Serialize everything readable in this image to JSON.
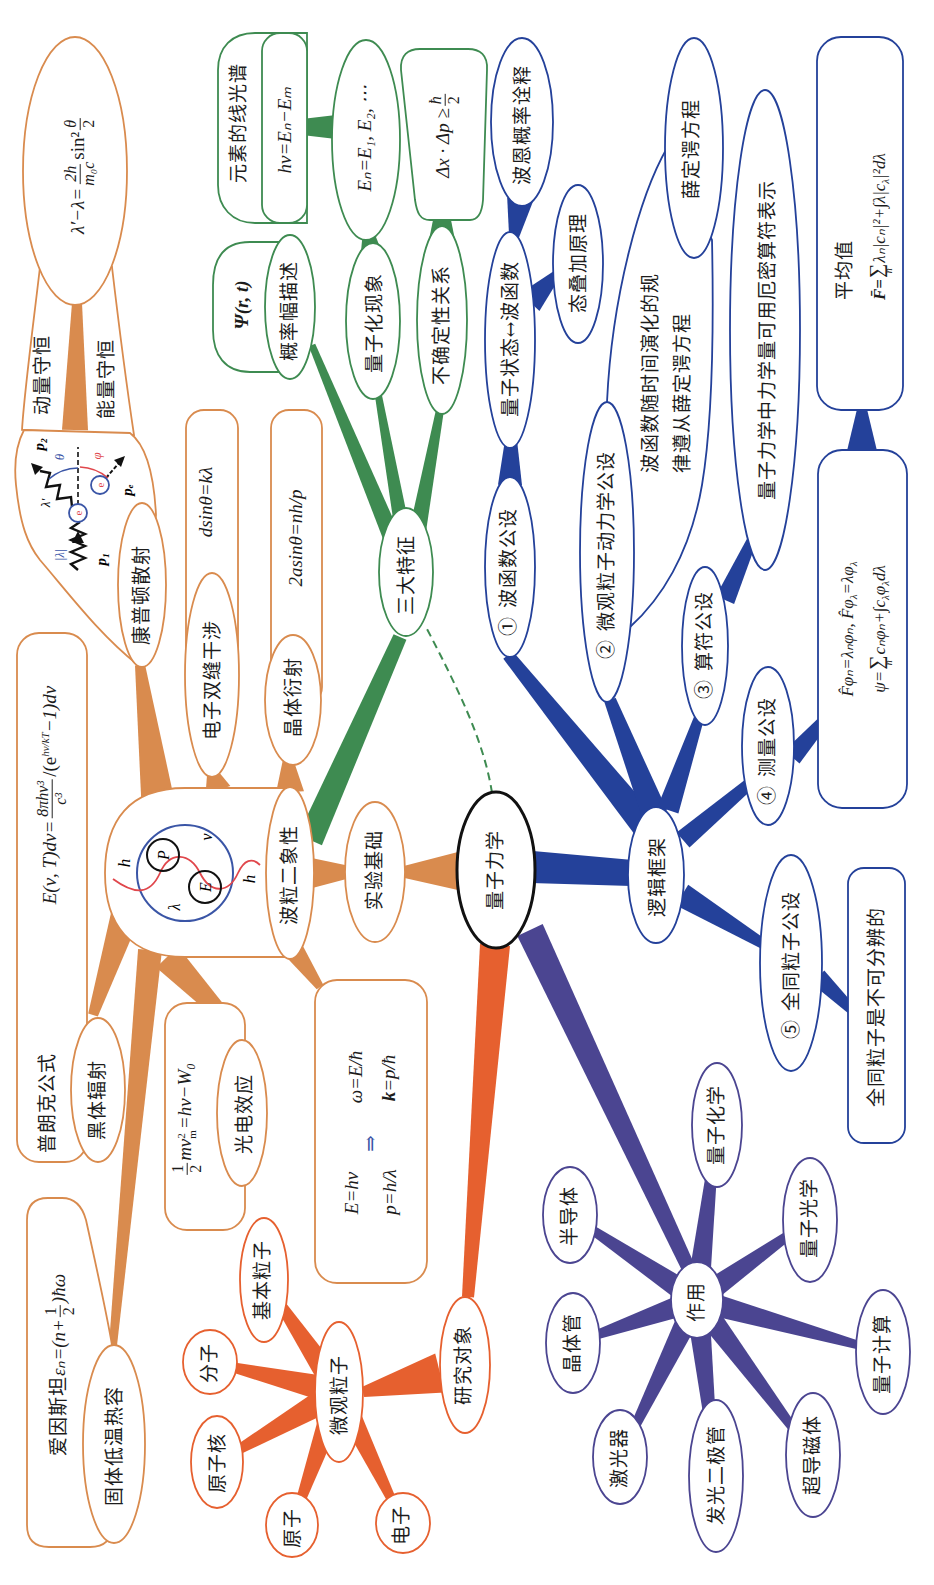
{
  "colors": {
    "orange": "#d98b4e",
    "red_orange": "#e6602f",
    "green": "#3e8b51",
    "blue": "#24419a",
    "purple": "#4b4591",
    "center_border": "#111111",
    "wave_red": "#e0474c",
    "circle_blue": "#3a55a6"
  },
  "center": {
    "label": "量子力学"
  },
  "experimental_basis": {
    "label": "实验基础",
    "wave_particle": {
      "label": "波粒二象性",
      "symbols": {
        "p": "P",
        "e": "E",
        "nu": "ν",
        "lambda": "λ",
        "h_top": "h",
        "h_bottom": "h"
      }
    },
    "de_broglie": {
      "energy": "E=hν",
      "momentum": "p=h/λ",
      "implies": "⇒",
      "omega": "ω=E/ħ",
      "k_symbol": "k",
      "k_rest": "=p/ħ"
    },
    "blackbody": {
      "label": "黑体辐射",
      "law": "普朗克公式",
      "formula": {
        "lhs": "E(ν, T)dν=",
        "num": "8πhν³",
        "den": "c³",
        "mid": "/(e",
        "exp": "hν/kT",
        "tail": "−1)dν"
      }
    },
    "photoelectric": {
      "label": "光电效应",
      "formula": {
        "num": "1",
        "den": "2",
        "body": "mv",
        "sup": "2",
        "sub": "m",
        "tail": "=hν−W₀"
      }
    },
    "double_slit": {
      "label": "电子双缝干涉",
      "formula": "dsinθ=kλ"
    },
    "crystal_diffraction": {
      "label": "晶体衍射",
      "formula": "2asinθ=nh/p"
    },
    "compton": {
      "label": "康普顿散射",
      "momentum_conservation": "动量守恒",
      "energy_conservation": "能量守恒",
      "formula": {
        "lhs": "λ′−λ=",
        "num": "2h",
        "den": "m₀c",
        "mid": "sin²",
        "num2": "θ",
        "den2": "2"
      },
      "diagram": {
        "lambda": "|λ|",
        "lambda_prime": "λ′",
        "p1": "p₁",
        "p2": "p₂",
        "pe": "pₑ",
        "theta": "θ",
        "phi": "φ",
        "electron": "e"
      }
    },
    "heat_capacity": {
      "label": "固体低温热容",
      "formula": {
        "prefix": "爱因斯坦",
        "lhs": "εₙ=",
        "open": "(n+",
        "num": "1",
        "den": "2",
        "close": ")ħω"
      }
    }
  },
  "research_object": {
    "label": "研究对象",
    "micro_particles": {
      "label": "微观粒子",
      "items": [
        "基本粒子",
        "分子",
        "原子核",
        "原子",
        "电子"
      ]
    }
  },
  "three_features": {
    "label": "三大特征",
    "probability_amplitude": {
      "label": "概率幅描述",
      "symbol": "Ψ(r, t)"
    },
    "quantization": {
      "label": "量子化现象",
      "levels": "Eₙ=E₁, E₂, ⋯",
      "spectrum_label": "元素的线光谱",
      "spectrum_formula": "hν=Eₙ−Eₘ"
    },
    "uncertainty": {
      "label": "不确定性关系",
      "formula": {
        "lhs": "Δx · Δp ≥",
        "num": "ħ",
        "den": "2"
      }
    }
  },
  "logical_framework": {
    "label": "逻辑框架",
    "wavefunction": {
      "label": "① 波函数公设",
      "state": "量子状态↔波函数",
      "born": "波恩概率诠释",
      "superposition": "态叠加原理"
    },
    "dynamics": {
      "label": "② 微观粒子动力学公设",
      "desc_line1": "波函数随时间演化的规",
      "desc_line2": "律遵从薛定谔方程",
      "equation": "薛定谔方程"
    },
    "operator": {
      "label": "③ 算符公设",
      "desc": "量子力学中力学量可用厄密算符表示"
    },
    "measurement": {
      "label": "④ 测量公设",
      "eigen": {
        "a": "F̂φₙ=λₙφₙ, F̂φ",
        "sub1": "λ",
        "b": "=λφ",
        "sub2": "λ"
      },
      "expansion": {
        "a": "ψ=",
        "sigma": "∑",
        "sigma_sub": "n",
        "b": "cₙφₙ+∫c",
        "sub1": "λ",
        "c": "φ",
        "sub2": "λ",
        "d": "dλ"
      },
      "mean_label": "平均值",
      "mean": {
        "a": "F̄=",
        "sigma": "∑",
        "sigma_sub": "n",
        "b": "λₙ|cₙ|²+∫λ|c",
        "sub1": "λ",
        "c": "|²dλ"
      }
    },
    "identical": {
      "label": "⑤ 全同粒子公设",
      "desc": "全同粒子是不可分辨的"
    }
  },
  "applications": {
    "label": "作用",
    "items": [
      "半导体",
      "晶体管",
      "激光器",
      "发光二极管",
      "超导磁体",
      "量子计算",
      "量子光学",
      "量子化学"
    ]
  }
}
